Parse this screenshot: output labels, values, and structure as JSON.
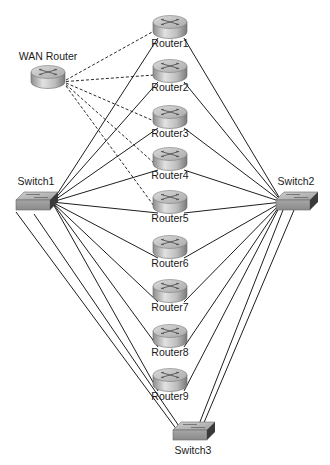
{
  "nodes": {
    "wan": {
      "label": "WAN Router",
      "type": "router"
    },
    "routers": [
      {
        "id": "r1",
        "label": "Router1"
      },
      {
        "id": "r2",
        "label": "Router2"
      },
      {
        "id": "r3",
        "label": "Router3"
      },
      {
        "id": "r4",
        "label": "Router4"
      },
      {
        "id": "r5",
        "label": "Router5"
      },
      {
        "id": "r6",
        "label": "Router6"
      },
      {
        "id": "r7",
        "label": "Router7"
      },
      {
        "id": "r8",
        "label": "Router8"
      },
      {
        "id": "r9",
        "label": "Router9"
      }
    ],
    "switches": [
      {
        "id": "s1",
        "label": "Switch1"
      },
      {
        "id": "s2",
        "label": "Switch2"
      },
      {
        "id": "s3",
        "label": "Switch3"
      }
    ]
  },
  "links": {
    "wan_dashed": [
      "r1",
      "r2",
      "r3",
      "r4",
      "r5"
    ],
    "switch1_to_routers": [
      "r1",
      "r2",
      "r3",
      "r4",
      "r5",
      "r6",
      "r7",
      "r8",
      "r9"
    ],
    "switch2_to_routers": [
      "r1",
      "r2",
      "r3",
      "r4",
      "r5",
      "r6",
      "r7",
      "r8",
      "r9"
    ],
    "switch1_to_switch3_count": 2,
    "switch2_to_switch3_count": 2
  },
  "colors": {
    "line": "#1e1e1e",
    "router_body": "#b4b4b4",
    "switch_body": "#9a9a9a",
    "switch_side": "#3a3a3a"
  }
}
